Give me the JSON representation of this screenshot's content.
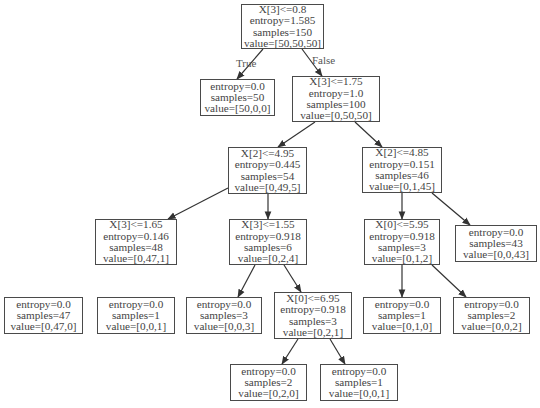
{
  "diagram": {
    "type": "decision-tree",
    "edge_labels": {
      "true": "True",
      "false": "False"
    },
    "nodes": [
      {
        "id": "n0",
        "lines": [
          "X[3]<=0.8",
          "entropy=1.585",
          "samples=150",
          "value=[50,50,50]"
        ],
        "box": [
          241,
          4,
          83,
          45
        ]
      },
      {
        "id": "n1",
        "lines": [
          "entropy=0.0",
          "samples=50",
          "value=[50,0,0]"
        ],
        "box": [
          200,
          79,
          75,
          37
        ]
      },
      {
        "id": "n2",
        "lines": [
          "X[3]<=1.75",
          "entropy=1.0",
          "samples=100",
          "value=[0,50,50]"
        ],
        "box": [
          292,
          76,
          88,
          46
        ]
      },
      {
        "id": "n3",
        "lines": [
          "X[2]<=4.95",
          "entropy=0.445",
          "samples=54",
          "value=[0,49,5]"
        ],
        "box": [
          228,
          147,
          79,
          47
        ]
      },
      {
        "id": "n4",
        "lines": [
          "X[2]<=4.85",
          "entropy=0.151",
          "samples=46",
          "value=[0,1,45]"
        ],
        "box": [
          362,
          147,
          80,
          46
        ]
      },
      {
        "id": "n5",
        "lines": [
          "X[3]<=1.65",
          "entropy=0.146",
          "samples=48",
          "value=[0,47,1]"
        ],
        "box": [
          95,
          219,
          82,
          46
        ]
      },
      {
        "id": "n6",
        "lines": [
          "X[3]<=1.55",
          "entropy=0.918",
          "samples=6",
          "value=[0,2,4]"
        ],
        "box": [
          229,
          219,
          78,
          46
        ]
      },
      {
        "id": "n7",
        "lines": [
          "X[0]<=5.95",
          "entropy=0.918",
          "samples=3",
          "value=[0,1,2]"
        ],
        "box": [
          364,
          219,
          76,
          46
        ]
      },
      {
        "id": "n8",
        "lines": [
          "entropy=0.0",
          "samples=43",
          "value=[0,0,43]"
        ],
        "box": [
          455,
          225,
          82,
          37
        ]
      },
      {
        "id": "n9",
        "lines": [
          "entropy=0.0",
          "samples=47",
          "value=[0,47,0]"
        ],
        "box": [
          4,
          297,
          79,
          37
        ]
      },
      {
        "id": "n10",
        "lines": [
          "entropy=0.0",
          "samples=1",
          "value=[0,0,1]"
        ],
        "box": [
          97,
          297,
          78,
          37
        ]
      },
      {
        "id": "n11",
        "lines": [
          "entropy=0.0",
          "samples=3",
          "value=[0,0,3]"
        ],
        "box": [
          186,
          297,
          76,
          37
        ]
      },
      {
        "id": "n12",
        "lines": [
          "X[0]<=6.95",
          "entropy=0.918",
          "samples=3",
          "value=[0,2,1]"
        ],
        "box": [
          274,
          292,
          78,
          47
        ]
      },
      {
        "id": "n13",
        "lines": [
          "entropy=0.0",
          "samples=1",
          "value=[0,1,0]"
        ],
        "box": [
          363,
          297,
          78,
          37
        ]
      },
      {
        "id": "n14",
        "lines": [
          "entropy=0.0",
          "samples=2",
          "value=[0,0,2]"
        ],
        "box": [
          453,
          297,
          77,
          37
        ]
      },
      {
        "id": "n15",
        "lines": [
          "entropy=0.0",
          "samples=2",
          "value=[0,2,0]"
        ],
        "box": [
          230,
          364,
          77,
          37
        ]
      },
      {
        "id": "n16",
        "lines": [
          "entropy=0.0",
          "samples=1",
          "value=[0,0,1]"
        ],
        "box": [
          320,
          364,
          78,
          37
        ]
      }
    ],
    "edges": [
      {
        "from": "n0",
        "to": "n1",
        "pts": [
          263,
          49,
          237,
          79
        ],
        "label": "True"
      },
      {
        "from": "n0",
        "to": "n2",
        "pts": [
          302,
          49,
          322,
          76
        ],
        "label": "False"
      },
      {
        "from": "n2",
        "to": "n3",
        "pts": [
          315,
          122,
          278,
          147
        ]
      },
      {
        "from": "n2",
        "to": "n4",
        "pts": [
          355,
          122,
          382,
          147
        ]
      },
      {
        "from": "n3",
        "to": "n5",
        "pts": [
          228,
          188,
          168,
          219
        ]
      },
      {
        "from": "n3",
        "to": "n6",
        "pts": [
          268,
          194,
          268,
          219
        ]
      },
      {
        "from": "n4",
        "to": "n7",
        "pts": [
          402,
          193,
          402,
          219
        ]
      },
      {
        "from": "n4",
        "to": "n8",
        "pts": [
          432,
          193,
          470,
          225
        ]
      },
      {
        "from": "n6",
        "to": "n11",
        "pts": [
          255,
          265,
          238,
          297
        ]
      },
      {
        "from": "n6",
        "to": "n12",
        "pts": [
          284,
          265,
          301,
          292
        ]
      },
      {
        "from": "n7",
        "to": "n13",
        "pts": [
          402,
          265,
          402,
          297
        ]
      },
      {
        "from": "n7",
        "to": "n14",
        "pts": [
          432,
          265,
          466,
          297
        ]
      },
      {
        "from": "n12",
        "to": "n15",
        "pts": [
          298,
          339,
          282,
          364
        ]
      },
      {
        "from": "n12",
        "to": "n16",
        "pts": [
          330,
          339,
          345,
          364
        ]
      }
    ]
  }
}
